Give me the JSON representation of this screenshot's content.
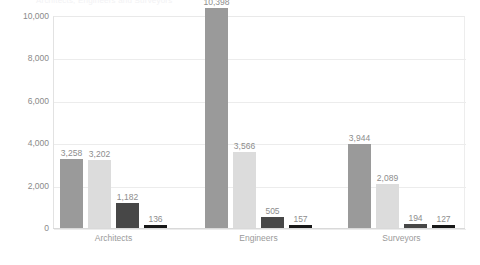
{
  "title_clipped": "Architects, Engineers and Surveyors",
  "chart_data": {
    "type": "bar",
    "title": "",
    "xlabel": "",
    "ylabel": "",
    "ylim": [
      0,
      10000
    ],
    "yticks": [
      "0",
      "2,000",
      "4,000",
      "6,000",
      "8,000",
      "10,000"
    ],
    "ytick_values": [
      0,
      2000,
      4000,
      6000,
      8000,
      10000
    ],
    "grid": true,
    "legend": "none",
    "categories": [
      "Architects",
      "Engineers",
      "Surveyors"
    ],
    "series": [
      {
        "name": "series-1",
        "color": "#9a9a9a",
        "values": [
          3258,
          10398,
          3944
        ],
        "labels": [
          "3,258",
          "10,398",
          "3,944"
        ]
      },
      {
        "name": "series-2",
        "color": "#dcdcdc",
        "values": [
          3202,
          3566,
          2089
        ],
        "labels": [
          "3,202",
          "3,566",
          "2,089"
        ]
      },
      {
        "name": "series-3",
        "color": "#474747",
        "values": [
          1182,
          505,
          194
        ],
        "labels": [
          "1,182",
          "505",
          "194"
        ]
      },
      {
        "name": "series-4",
        "color": "#181818",
        "values": [
          136,
          157,
          127
        ],
        "labels": [
          "136",
          "157",
          "127"
        ]
      }
    ]
  }
}
